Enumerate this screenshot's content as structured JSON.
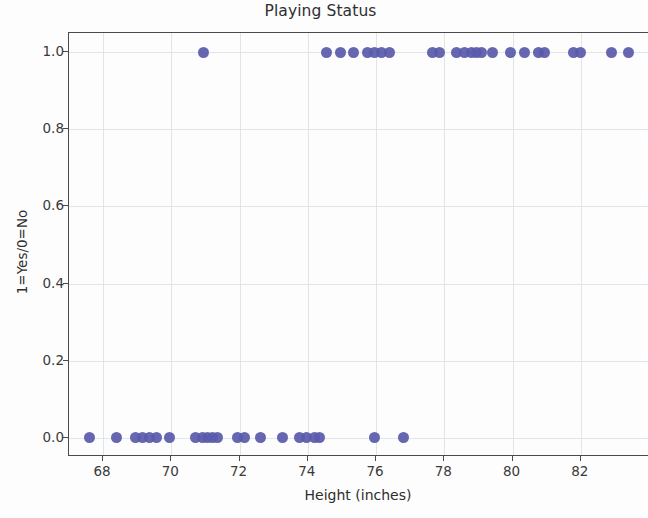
{
  "chart_data": {
    "type": "scatter",
    "title": "Playing Status",
    "xlabel": "Height (inches)",
    "ylabel": "1=Yes/0=No",
    "xlim": [
      67.0,
      84.0
    ],
    "ylim": [
      -0.05,
      1.05
    ],
    "xticks": [
      68,
      70,
      72,
      74,
      76,
      78,
      80,
      82
    ],
    "yticks": [
      0.0,
      0.2,
      0.4,
      0.6,
      0.8,
      1.0
    ],
    "xticklabels": [
      "68",
      "70",
      "72",
      "74",
      "76",
      "78",
      "80",
      "82"
    ],
    "yticklabels": [
      "0.0",
      "0.2",
      "0.4",
      "0.6",
      "0.8",
      "1.0"
    ],
    "grid": true,
    "legend": null,
    "marker_color": "#5a5aab",
    "marker_size": 11,
    "series": [
      {
        "name": "Playing Status",
        "x": [
          70.95,
          74.55,
          74.95,
          75.35,
          75.75,
          75.95,
          76.15,
          76.4,
          77.65,
          77.85,
          78.35,
          78.6,
          78.8,
          78.95,
          79.1,
          79.4,
          79.95,
          80.35,
          80.75,
          80.95,
          81.8,
          82.0,
          82.9,
          83.4
        ],
        "y": [
          1,
          1,
          1,
          1,
          1,
          1,
          1,
          1,
          1,
          1,
          1,
          1,
          1,
          1,
          1,
          1,
          1,
          1,
          1,
          1,
          1,
          1,
          1,
          1
        ]
      },
      {
        "name": "Not Playing",
        "x": [
          67.6,
          68.4,
          68.95,
          69.15,
          69.35,
          69.55,
          69.95,
          70.7,
          70.9,
          71.05,
          71.2,
          71.35,
          71.95,
          72.15,
          72.6,
          73.25,
          73.75,
          73.95,
          74.2,
          74.35,
          75.95,
          76.8
        ],
        "y": [
          0,
          0,
          0,
          0,
          0,
          0,
          0,
          0,
          0,
          0,
          0,
          0,
          0,
          0,
          0,
          0,
          0,
          0,
          0,
          0,
          0,
          0
        ]
      }
    ]
  },
  "axes": {
    "x_min": 67.0,
    "x_max": 84.0,
    "y_min": -0.05,
    "y_max": 1.05
  }
}
